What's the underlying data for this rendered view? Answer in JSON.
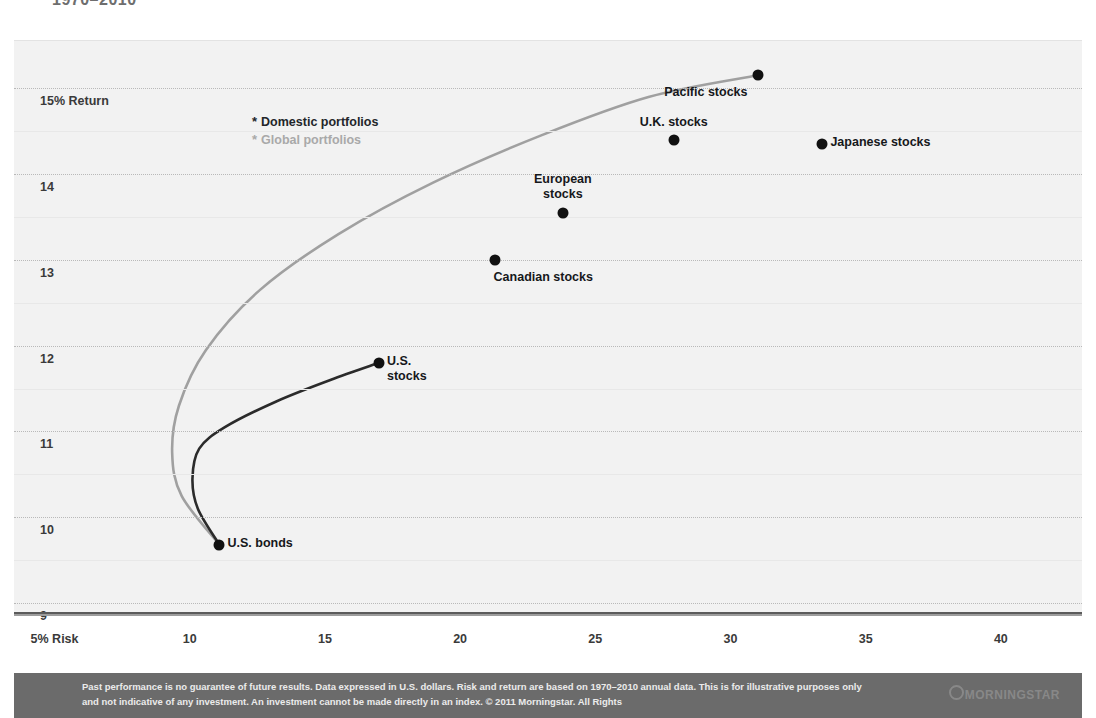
{
  "title": "1970–2010",
  "legend": {
    "position": "inside-top-left",
    "items": [
      {
        "label": "Domestic portfolios",
        "color": "#23262a",
        "bullet": "*"
      },
      {
        "label": "Global portfolios",
        "color": "#a9a9a9",
        "bullet": "*"
      }
    ]
  },
  "footer": {
    "disclaimer": "Past performance is no guarantee of future results. Data expressed in U.S. dollars. Risk and return are based on 1970–2010 annual data. This is for illustrative purposes only and not indicative of any investment. An investment cannot be made directly in an index. © 2011 Morningstar. All Rights",
    "logo": "MORNINGSTAR"
  },
  "chart_data": {
    "type": "scatter",
    "title": "1970–2010",
    "xlabel": "Risk",
    "ylabel": "Return",
    "xlim": [
      3.5,
      43
    ],
    "ylim": [
      8.85,
      15.55
    ],
    "grid": true,
    "xticks": [
      5,
      10,
      15,
      20,
      25,
      30,
      35,
      40
    ],
    "xticklabels": [
      "5% Risk",
      "10",
      "15",
      "20",
      "25",
      "30",
      "35",
      "40"
    ],
    "yticks": [
      15,
      14,
      13,
      12,
      11,
      10,
      9
    ],
    "yticklabels": [
      "15% Return",
      "14",
      "13",
      "12",
      "11",
      "10",
      "9"
    ],
    "points": [
      {
        "label": "Pacific stocks",
        "x": 31.0,
        "y": 15.15,
        "label_pos": "below-left"
      },
      {
        "label": "U.K. stocks",
        "x": 27.9,
        "y": 14.4,
        "label_pos": "above"
      },
      {
        "label": "Japanese stocks",
        "x": 33.4,
        "y": 14.35,
        "label_pos": "right"
      },
      {
        "label": "European stocks",
        "x": 23.8,
        "y": 13.55,
        "label_pos": "above",
        "multiline": [
          "European",
          "stocks"
        ]
      },
      {
        "label": "Canadian stocks",
        "x": 21.3,
        "y": 13.0,
        "label_pos": "below"
      },
      {
        "label": "U.S. stocks",
        "x": 17.0,
        "y": 11.8,
        "label_pos": "right",
        "multiline": [
          "U.S.",
          "stocks"
        ]
      },
      {
        "label": "U.S. bonds",
        "x": 11.1,
        "y": 9.68,
        "label_pos": "right"
      }
    ],
    "series": [
      {
        "name": "Domestic portfolios",
        "color": "#2b2b2b",
        "type": "frontier-curve",
        "points": [
          {
            "x": 11.1,
            "y": 9.68
          },
          {
            "x": 10.3,
            "y": 10.1
          },
          {
            "x": 10.1,
            "y": 10.45
          },
          {
            "x": 10.35,
            "y": 10.8
          },
          {
            "x": 11.3,
            "y": 11.05
          },
          {
            "x": 13.2,
            "y": 11.35
          },
          {
            "x": 15.2,
            "y": 11.6
          },
          {
            "x": 17.0,
            "y": 11.8
          }
        ]
      },
      {
        "name": "Global portfolios",
        "color": "#a0a0a0",
        "type": "frontier-curve",
        "points": [
          {
            "x": 11.1,
            "y": 9.68
          },
          {
            "x": 9.7,
            "y": 10.25
          },
          {
            "x": 9.35,
            "y": 10.75
          },
          {
            "x": 9.6,
            "y": 11.3
          },
          {
            "x": 10.6,
            "y": 11.95
          },
          {
            "x": 12.6,
            "y": 12.65
          },
          {
            "x": 15.5,
            "y": 13.3
          },
          {
            "x": 19.0,
            "y": 13.9
          },
          {
            "x": 23.0,
            "y": 14.45
          },
          {
            "x": 27.0,
            "y": 14.9
          },
          {
            "x": 31.0,
            "y": 15.15
          }
        ]
      }
    ]
  }
}
